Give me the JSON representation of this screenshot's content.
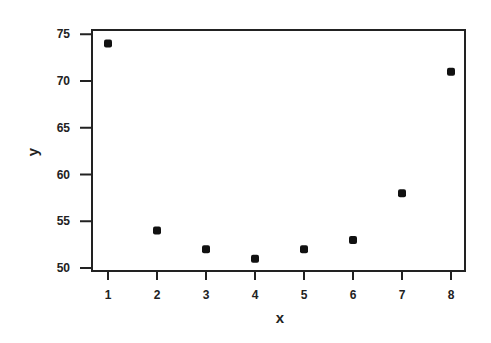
{
  "chart_data": {
    "type": "scatter",
    "title": "",
    "xlabel": "x",
    "ylabel": "y",
    "x": [
      1,
      2,
      3,
      4,
      5,
      6,
      7,
      8
    ],
    "series": [
      {
        "name": "y",
        "values": [
          74,
          54,
          52,
          51,
          52,
          53,
          58,
          71
        ]
      }
    ],
    "xticks": [
      1,
      2,
      3,
      4,
      5,
      6,
      7,
      8
    ],
    "yticks": [
      50,
      55,
      60,
      65,
      70,
      75
    ],
    "xlim": [
      0.7,
      8.3
    ],
    "ylim": [
      49.6,
      75.4
    ],
    "grid": false,
    "legend": "none",
    "marker": "filled square",
    "colors": {
      "marker": "#111111",
      "axis": "#222222",
      "background": "#ffffff"
    }
  }
}
